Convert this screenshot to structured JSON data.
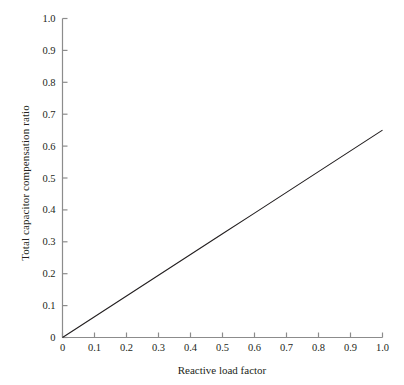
{
  "chart_data": {
    "type": "line",
    "title": "",
    "xlabel": "Reactive load factor",
    "ylabel": "Total capacitor compensation ratio",
    "xlim": [
      0,
      1.0
    ],
    "ylim": [
      0,
      1.0
    ],
    "grid": false,
    "legend": null,
    "x_ticks": [
      "0",
      "0.1",
      "0.2",
      "0.3",
      "0.4",
      "0.5",
      "0.6",
      "0.7",
      "0.8",
      "0.9",
      "1.0"
    ],
    "x_tick_values": [
      0,
      0.1,
      0.2,
      0.3,
      0.4,
      0.5,
      0.6,
      0.7,
      0.8,
      0.9,
      1.0
    ],
    "y_ticks": [
      "0",
      "0.1",
      "0.2",
      "0.3",
      "0.4",
      "0.5",
      "0.6",
      "0.7",
      "0.8",
      "0.9",
      "1.0"
    ],
    "y_tick_values": [
      0,
      0.1,
      0.2,
      0.3,
      0.4,
      0.5,
      0.6,
      0.7,
      0.8,
      0.9,
      1.0
    ],
    "series": [
      {
        "name": "Total capacitor compensation ratio",
        "color": "#231f20",
        "x": [
          0,
          0.1,
          0.2,
          0.3,
          0.4,
          0.5,
          0.6,
          0.7,
          0.8,
          0.9,
          1.0
        ],
        "values": [
          0.0,
          0.065,
          0.13,
          0.195,
          0.26,
          0.325,
          0.39,
          0.455,
          0.52,
          0.585,
          0.65
        ]
      }
    ],
    "annotations": [],
    "axis_color": "#8c8c8c",
    "line_color": "#231f20"
  }
}
